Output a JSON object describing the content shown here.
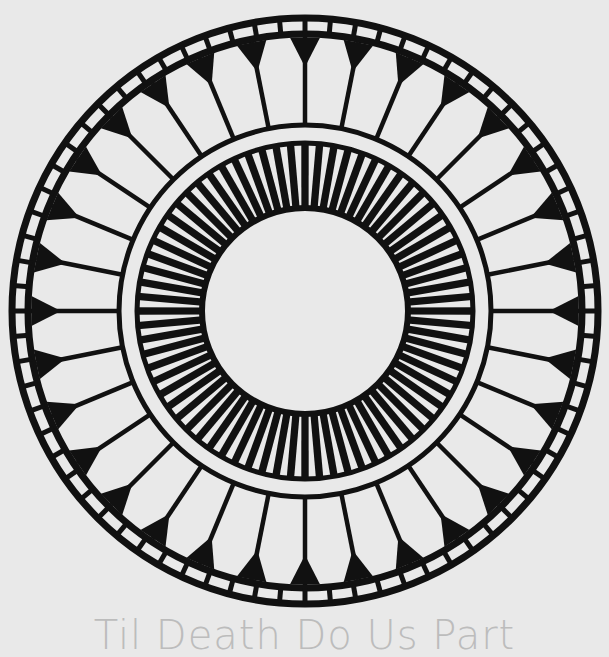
{
  "artwork": {
    "name": "circular-mandala",
    "center": [
      305,
      311
    ],
    "colors": {
      "ink": "#111111",
      "background": "#e9e9e9",
      "caption": "#bcbcbc"
    },
    "outer_ring": {
      "outer_radius": 296,
      "inner_radius": 274,
      "tile_count": 72
    },
    "petals": {
      "count": 32,
      "outer_radius": 274,
      "inner_radius": 186
    },
    "inner_ring": {
      "outer_radius": 168,
      "inner_radius": 103,
      "ray_count": 72
    }
  },
  "caption": {
    "text": "Til Death Do Us Part"
  }
}
